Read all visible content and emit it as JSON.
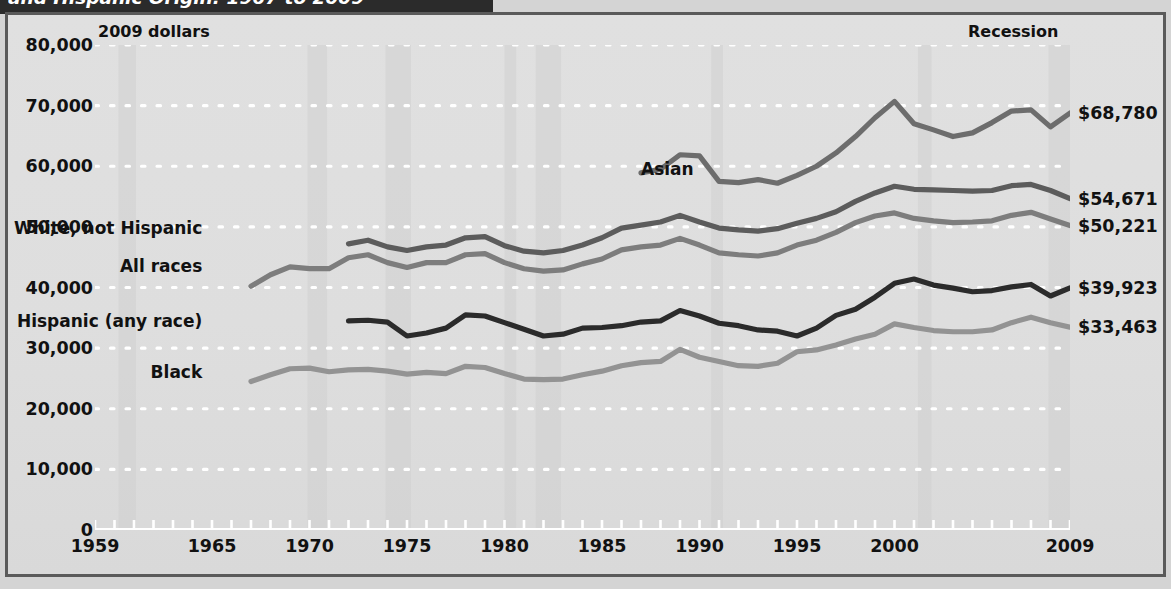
{
  "title": "and Hispanic Origin: 1967 to 2009",
  "unit_note": "2009 dollars",
  "recession_note": "Recession",
  "colors": {
    "background": "#dcdcdc",
    "frame": "#5a5a5a",
    "gridline": "#ffffff",
    "recession_band": "#cfcfcf",
    "asian": "#6d6d6d",
    "white_not_hispanic": "#5c5c5c",
    "all_races": "#7d7d7d",
    "hispanic": "#2b2b2b",
    "black": "#939393",
    "title_band": "#2b2b2b",
    "text": "#111111"
  },
  "chart_data": {
    "type": "line",
    "title": "and Hispanic Origin: 1967 to 2009",
    "xlabel": "",
    "ylabel": "2009 dollars",
    "xlim": [
      1959,
      2009
    ],
    "ylim": [
      0,
      80000
    ],
    "grid": true,
    "legend_position": "inline-labels",
    "y_ticks": [
      0,
      10000,
      20000,
      30000,
      40000,
      50000,
      60000,
      70000,
      80000
    ],
    "y_tick_labels": [
      "0",
      "10,000",
      "20,000",
      "30,000",
      "40,000",
      "50,000",
      "60,000",
      "70,000",
      "80,000"
    ],
    "x_ticks": [
      1959,
      1965,
      1970,
      1975,
      1980,
      1985,
      1990,
      1995,
      2000,
      2009
    ],
    "x_tick_labels": [
      "1959",
      "1965",
      "1970",
      "1975",
      "1980",
      "1985",
      "1990",
      "1995",
      "2000",
      "2009"
    ],
    "recession_bands": [
      {
        "start": 1960.2,
        "end": 1961.1
      },
      {
        "start": 1969.9,
        "end": 1970.9
      },
      {
        "start": 1973.9,
        "end": 1975.2
      },
      {
        "start": 1980.0,
        "end": 1980.6
      },
      {
        "start": 1981.6,
        "end": 1982.9
      },
      {
        "start": 1990.6,
        "end": 1991.2
      },
      {
        "start": 2001.2,
        "end": 2001.9
      },
      {
        "start": 2007.9,
        "end": 2009.5
      }
    ],
    "annotations": [
      {
        "text": "2009 dollars",
        "position": "top-left"
      },
      {
        "text": "Recession",
        "position": "top-right"
      }
    ],
    "series": [
      {
        "name": "Asian",
        "color": "#6d6d6d",
        "end_label": "$68,780",
        "label_x": 1987.0,
        "label_y": 59500,
        "x": [
          1987,
          1988,
          1989,
          1990,
          1991,
          1992,
          1993,
          1994,
          1995,
          1996,
          1997,
          1998,
          1999,
          2000,
          2001,
          2002,
          2003,
          2004,
          2005,
          2006,
          2007,
          2008,
          2009
        ],
        "values": [
          58900,
          59500,
          61900,
          61700,
          57500,
          57300,
          57800,
          57200,
          58500,
          60000,
          62200,
          64900,
          68000,
          70700,
          67000,
          66000,
          64900,
          65500,
          67200,
          69100,
          69300,
          66500,
          68780
        ]
      },
      {
        "name": "White, not Hispanic",
        "color": "#5c5c5c",
        "end_label": "$54,671",
        "label_x": 1964.5,
        "label_y": 49800,
        "x": [
          1972,
          1973,
          1974,
          1975,
          1976,
          1977,
          1978,
          1979,
          1980,
          1981,
          1982,
          1983,
          1984,
          1985,
          1986,
          1987,
          1988,
          1989,
          1990,
          1991,
          1992,
          1993,
          1994,
          1995,
          1996,
          1997,
          1998,
          1999,
          2000,
          2001,
          2002,
          2003,
          2004,
          2005,
          2006,
          2007,
          2008,
          2009
        ],
        "values": [
          47200,
          47800,
          46700,
          46100,
          46700,
          47000,
          48200,
          48400,
          46900,
          46000,
          45700,
          46100,
          47000,
          48200,
          49800,
          50300,
          50800,
          51900,
          50800,
          49800,
          49500,
          49300,
          49700,
          50600,
          51400,
          52500,
          54200,
          55600,
          56700,
          56200,
          56100,
          56000,
          55900,
          56000,
          56800,
          57000,
          56000,
          54671
        ]
      },
      {
        "name": "All races",
        "color": "#7d7d7d",
        "end_label": "$50,221",
        "label_x": 1964.5,
        "label_y": 43600,
        "x": [
          1967,
          1968,
          1969,
          1970,
          1971,
          1972,
          1973,
          1974,
          1975,
          1976,
          1977,
          1978,
          1979,
          1980,
          1981,
          1982,
          1983,
          1984,
          1985,
          1986,
          1987,
          1988,
          1989,
          1990,
          1991,
          1992,
          1993,
          1994,
          1995,
          1996,
          1997,
          1998,
          1999,
          2000,
          2001,
          2002,
          2003,
          2004,
          2005,
          2006,
          2007,
          2008,
          2009
        ],
        "values": [
          40200,
          42100,
          43400,
          43100,
          43100,
          44900,
          45400,
          44100,
          43300,
          44100,
          44100,
          45400,
          45600,
          44100,
          43100,
          42700,
          42900,
          43900,
          44700,
          46200,
          46700,
          47000,
          48100,
          47000,
          45700,
          45400,
          45200,
          45700,
          47000,
          47800,
          49100,
          50700,
          51800,
          52300,
          51400,
          51000,
          50700,
          50800,
          51000,
          51900,
          52400,
          51300,
          50221
        ]
      },
      {
        "name": "Hispanic (any race)",
        "color": "#2b2b2b",
        "end_label": "$39,923",
        "label_x": 1964.5,
        "label_y": 34400,
        "x": [
          1972,
          1973,
          1974,
          1975,
          1976,
          1977,
          1978,
          1979,
          1980,
          1981,
          1982,
          1983,
          1984,
          1985,
          1986,
          1987,
          1988,
          1989,
          1990,
          1991,
          1992,
          1993,
          1994,
          1995,
          1996,
          1997,
          1998,
          1999,
          2000,
          2001,
          2002,
          2003,
          2004,
          2005,
          2006,
          2007,
          2008,
          2009
        ],
        "values": [
          34500,
          34600,
          34300,
          32000,
          32500,
          33300,
          35500,
          35300,
          34200,
          33100,
          32000,
          32300,
          33300,
          33400,
          33700,
          34300,
          34500,
          36200,
          35300,
          34100,
          33700,
          33000,
          32800,
          32000,
          33300,
          35400,
          36400,
          38400,
          40700,
          41400,
          40400,
          39900,
          39300,
          39500,
          40100,
          40500,
          38600,
          39923
        ]
      },
      {
        "name": "Black",
        "color": "#939393",
        "end_label": "$33,463",
        "label_x": 1964.5,
        "label_y": 26000,
        "x": [
          1967,
          1968,
          1969,
          1970,
          1971,
          1972,
          1973,
          1974,
          1975,
          1976,
          1977,
          1978,
          1979,
          1980,
          1981,
          1982,
          1983,
          1984,
          1985,
          1986,
          1987,
          1988,
          1989,
          1990,
          1991,
          1992,
          1993,
          1994,
          1995,
          1996,
          1997,
          1998,
          1999,
          2000,
          2001,
          2002,
          2003,
          2004,
          2005,
          2006,
          2007,
          2008,
          2009
        ],
        "values": [
          24500,
          25600,
          26600,
          26700,
          26100,
          26400,
          26500,
          26200,
          25700,
          26000,
          25800,
          27000,
          26800,
          25800,
          24900,
          24800,
          24900,
          25600,
          26200,
          27100,
          27600,
          27800,
          29800,
          28500,
          27800,
          27100,
          27000,
          27500,
          29400,
          29700,
          30500,
          31500,
          32300,
          34000,
          33400,
          32900,
          32700,
          32700,
          33000,
          34200,
          35100,
          34200,
          33463
        ]
      }
    ]
  }
}
